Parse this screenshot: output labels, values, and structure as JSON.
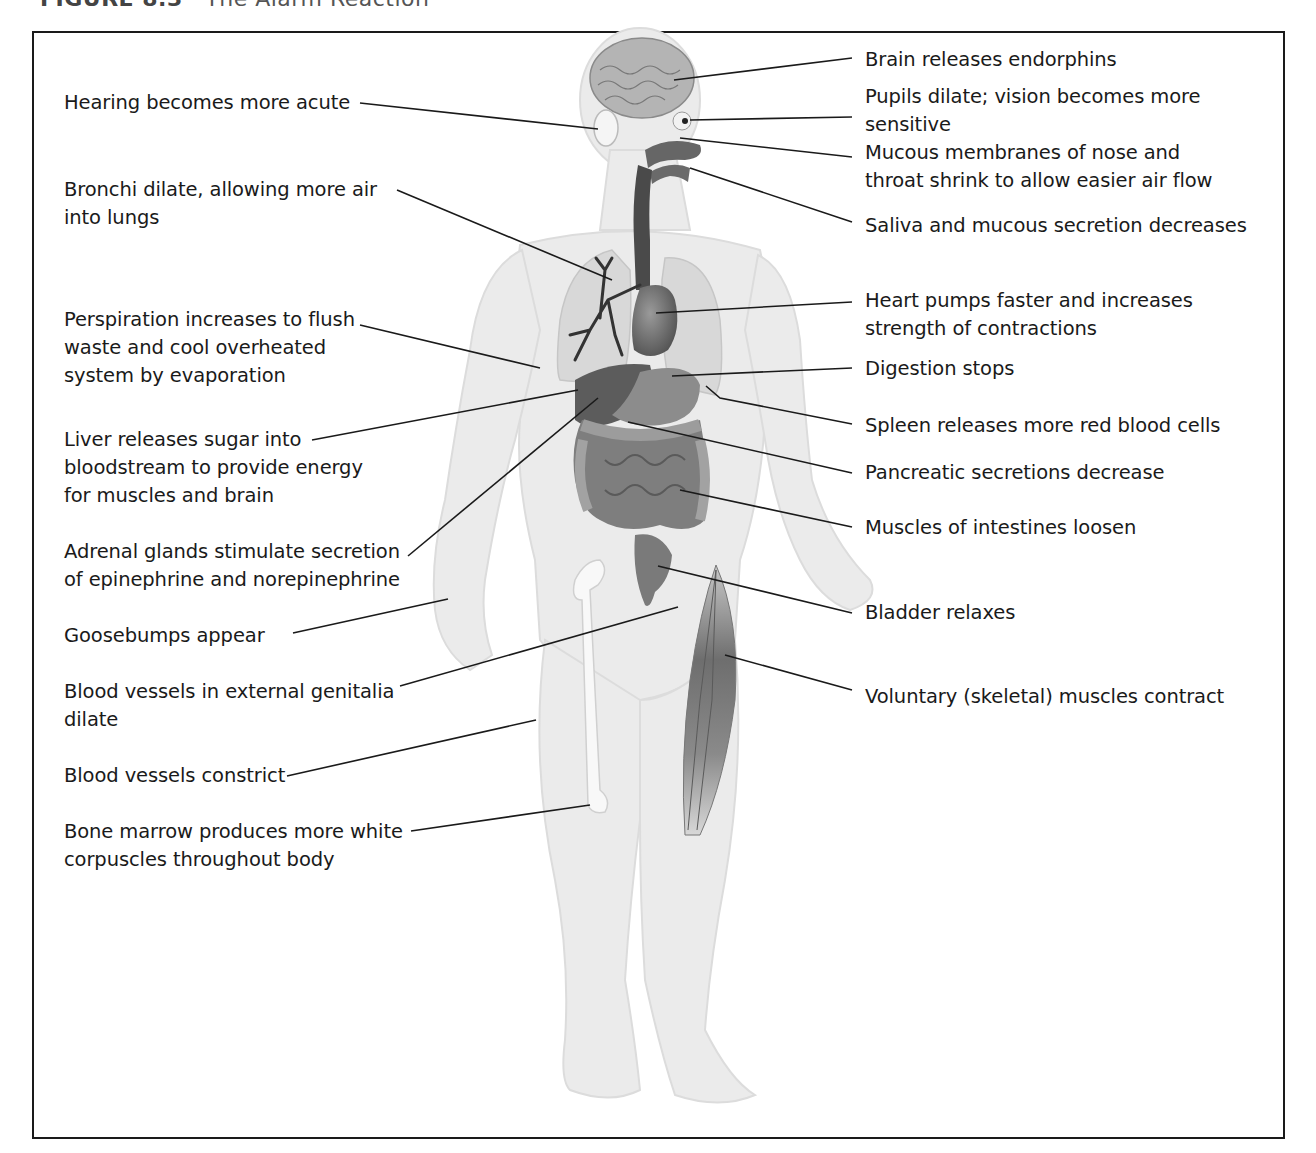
{
  "header": {
    "figure_number": "FIGURE 8.3",
    "separator": "·",
    "title": "The Alarm Reaction"
  },
  "colors": {
    "frame": "#1a1a1a",
    "body_fill": "#e9e9e9",
    "organ_dark": "#5a5a5a",
    "organ_mid": "#8a8a8a",
    "leader_line": "#1a1a1a"
  },
  "labels_left": [
    {
      "id": "hearing",
      "text": "Hearing becomes more acute"
    },
    {
      "id": "bronchi",
      "text": "Bronchi dilate, allowing more air\ninto lungs"
    },
    {
      "id": "perspiration",
      "text": "Perspiration increases to flush\nwaste and cool overheated\nsystem by evaporation"
    },
    {
      "id": "liver",
      "text": "Liver releases sugar into\nbloodstream to provide energy\nfor muscles and brain"
    },
    {
      "id": "adrenal",
      "text": "Adrenal glands stimulate secretion\nof epinephrine and norepinephrine"
    },
    {
      "id": "goosebumps",
      "text": "Goosebumps appear"
    },
    {
      "id": "genitalia",
      "text": "Blood vessels in external genitalia\ndilate"
    },
    {
      "id": "vessels",
      "text": "Blood vessels constrict"
    },
    {
      "id": "marrow",
      "text": "Bone marrow produces more white\ncorpuscles throughout body"
    }
  ],
  "labels_right": [
    {
      "id": "brain",
      "text": "Brain releases endorphins"
    },
    {
      "id": "pupils",
      "text": "Pupils dilate; vision becomes more\nsensitive"
    },
    {
      "id": "mucous",
      "text": "Mucous membranes of nose and\nthroat shrink to allow easier air flow"
    },
    {
      "id": "saliva",
      "text": "Saliva and mucous secretion decreases"
    },
    {
      "id": "heart",
      "text": "Heart pumps faster and increases\nstrength of contractions"
    },
    {
      "id": "digestion",
      "text": "Digestion stops"
    },
    {
      "id": "spleen",
      "text": "Spleen releases more red blood cells"
    },
    {
      "id": "pancreas",
      "text": "Pancreatic secretions decrease"
    },
    {
      "id": "intestines",
      "text": "Muscles of intestines loosen"
    },
    {
      "id": "bladder",
      "text": "Bladder relaxes"
    },
    {
      "id": "skeletal",
      "text": "Voluntary (skeletal) muscles contract"
    }
  ]
}
